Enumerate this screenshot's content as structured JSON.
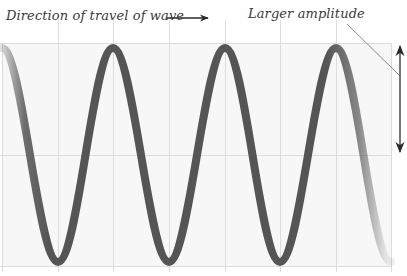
{
  "figure": {
    "type": "wave-diagram",
    "labels": {
      "direction": "Direction of travel of wave",
      "amplitude": "Larger amplitude"
    },
    "colors": {
      "background": "#ffffff",
      "grid_fill": "#f7f7f7",
      "grid_line": "#dcdcdc",
      "wave": "#555555",
      "arrow": "#2a2a2a",
      "leader_line": "#8a8a8a"
    },
    "grid": {
      "vertical_lines_x": [
        2,
        58,
        113,
        169,
        225,
        280,
        336,
        391
      ],
      "horizontal_lines_y": [
        43,
        155,
        266
      ]
    },
    "wave": {
      "peaks_x": [
        113,
        225,
        336
      ],
      "troughs_x": [
        58,
        169,
        280
      ],
      "peak_y": 48,
      "trough_y": 262,
      "center_y": 155,
      "stroke_width": 8,
      "faded_ends": true
    },
    "direction_arrow": {
      "x1": 167,
      "x2": 208,
      "y": 18,
      "points": "right"
    },
    "amplitude_arrow": {
      "x": 400,
      "y1": 45,
      "y2": 152,
      "double_headed": true
    },
    "leader_line": {
      "x1": 347,
      "y1": 24,
      "x2": 400,
      "y2": 76
    }
  }
}
